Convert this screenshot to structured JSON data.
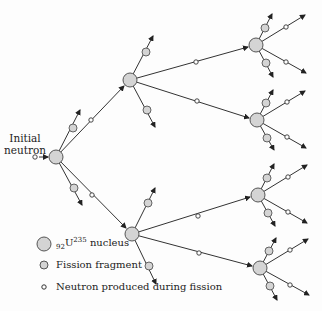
{
  "diagram": {
    "initial_label_line1": "Initial",
    "initial_label_line2": "neutron",
    "legend": {
      "nucleus_prefix": "92",
      "nucleus_symbol": "U",
      "nucleus_mass": "235",
      "nucleus_suffix": " nucleus",
      "fragment": "Fission fragment",
      "neutron": "Neutron produced during fission"
    },
    "colors": {
      "nucleus_fill": "#d4d4d4",
      "stroke": "#333333",
      "neutron_fill": "#ffffff"
    }
  }
}
